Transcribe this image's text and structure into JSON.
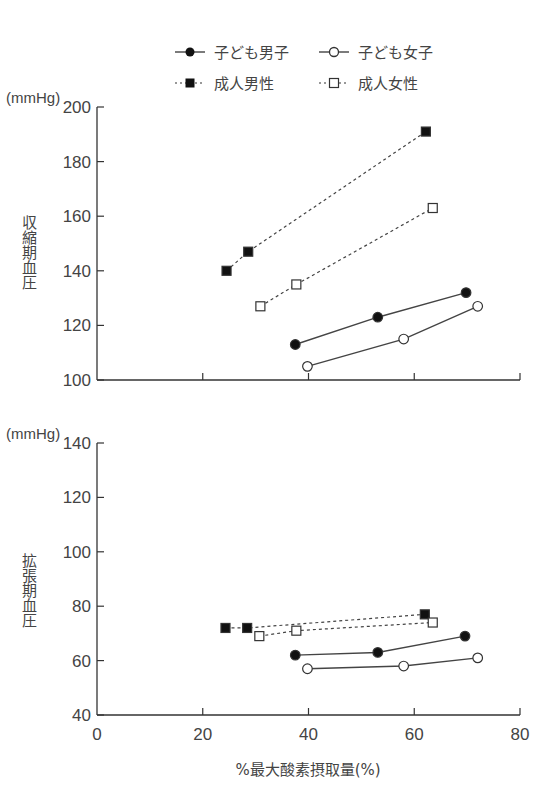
{
  "legend": {
    "items": [
      {
        "name": "子ども男子",
        "marker": "filled-circle",
        "line": "solid"
      },
      {
        "name": "子ども女子",
        "marker": "open-circle",
        "line": "solid"
      },
      {
        "name": "成人男性",
        "marker": "filled-square",
        "line": "dashed"
      },
      {
        "name": "成人女性",
        "marker": "open-square",
        "line": "dashed"
      }
    ]
  },
  "xaxis": {
    "label": "%最大酸素摂取量(%)",
    "ticks": [
      "0",
      "20",
      "40",
      "60",
      "80"
    ]
  },
  "top": {
    "unit": "(mmHg)",
    "ylabel": "収縮期血圧",
    "ticks": [
      "100",
      "120",
      "140",
      "160",
      "180",
      "200"
    ]
  },
  "bottom": {
    "unit": "(mmHg)",
    "ylabel": "拡張期血圧",
    "ticks": [
      "40",
      "60",
      "80",
      "100",
      "120",
      "140"
    ]
  },
  "chart_data": [
    {
      "type": "line",
      "title": "",
      "xlabel": "%最大酸素摂取量(%)",
      "ylabel": "収縮期血圧 (mmHg)",
      "xlim": [
        0,
        80
      ],
      "ylim": [
        100,
        200
      ],
      "x_ticks": [
        0,
        20,
        40,
        60,
        80
      ],
      "y_ticks": [
        100,
        120,
        140,
        160,
        180,
        200
      ],
      "grid": false,
      "legend_position": "top",
      "series": [
        {
          "name": "子ども男子",
          "x": [
            37.5,
            53.1,
            69.8
          ],
          "y": [
            113,
            123,
            132
          ]
        },
        {
          "name": "子ども女子",
          "x": [
            39.8,
            58.0,
            72.0
          ],
          "y": [
            105,
            115,
            127
          ]
        },
        {
          "name": "成人男性",
          "x": [
            24.5,
            28.6,
            62.2
          ],
          "y": [
            140,
            147,
            191
          ]
        },
        {
          "name": "成人女性",
          "x": [
            30.9,
            37.7,
            63.5
          ],
          "y": [
            127,
            135,
            163
          ]
        }
      ]
    },
    {
      "type": "line",
      "title": "",
      "xlabel": "%最大酸素摂取量(%)",
      "ylabel": "拡張期血圧 (mmHg)",
      "xlim": [
        0,
        80
      ],
      "ylim": [
        40,
        140
      ],
      "x_ticks": [
        0,
        20,
        40,
        60,
        80
      ],
      "y_ticks": [
        40,
        60,
        80,
        100,
        120,
        140
      ],
      "grid": false,
      "legend_position": "top",
      "series": [
        {
          "name": "子ども男子",
          "x": [
            37.5,
            53.1,
            69.6
          ],
          "y": [
            62,
            63,
            69
          ]
        },
        {
          "name": "子ども女子",
          "x": [
            39.8,
            58.0,
            72.0
          ],
          "y": [
            57,
            58,
            61
          ]
        },
        {
          "name": "成人男性",
          "x": [
            24.3,
            28.4,
            62.0
          ],
          "y": [
            72,
            72,
            77
          ]
        },
        {
          "name": "成人女性",
          "x": [
            30.7,
            37.7,
            63.5
          ],
          "y": [
            69,
            71,
            74
          ]
        }
      ]
    }
  ]
}
